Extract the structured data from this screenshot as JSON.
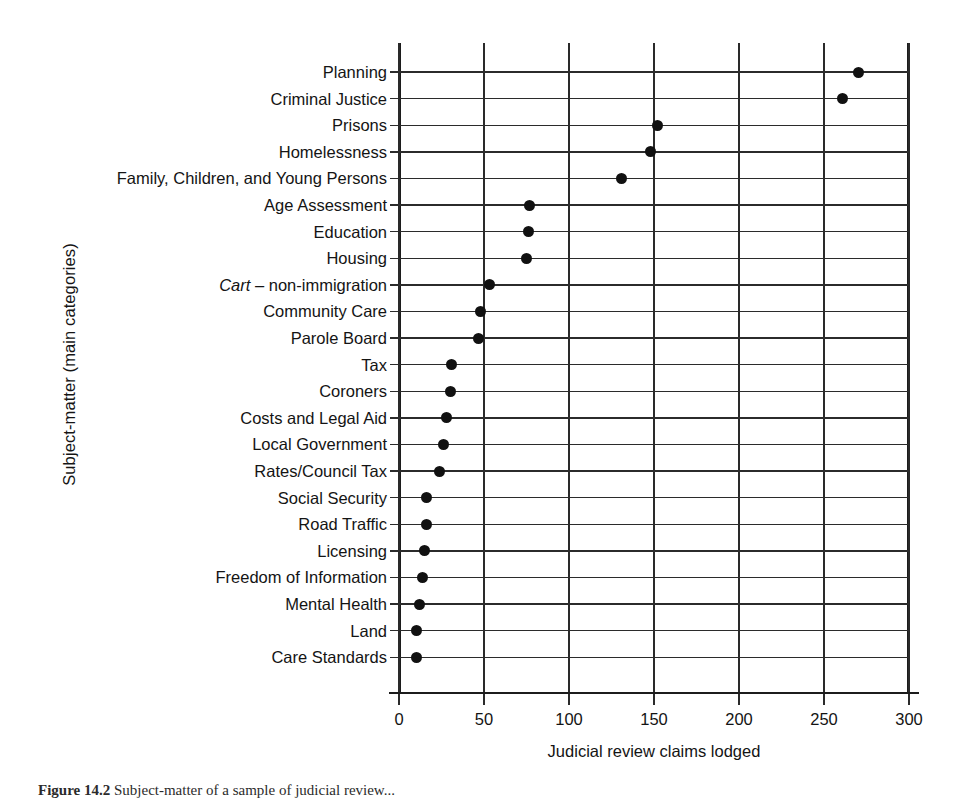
{
  "chart_data": {
    "type": "scatter",
    "title": "",
    "xlabel": "Judicial review claims lodged",
    "ylabel": "Subject-matter (main categories)",
    "xlim": [
      0,
      300
    ],
    "xticks": [
      0,
      50,
      100,
      150,
      200,
      250,
      300
    ],
    "xticklabels": [
      "0",
      "50",
      "100",
      "150",
      "200",
      "250",
      "300"
    ],
    "grid": true,
    "legend": "none",
    "orientation": "horizontal",
    "categories": [
      "Planning",
      "Criminal Justice",
      "Prisons",
      "Homelessness",
      "Family, Children, and Young Persons",
      "Age Assessment",
      "Education",
      "Housing",
      "Cart – non-immigration",
      "Community Care",
      "Parole Board",
      "Tax",
      "Coroners",
      "Costs and Legal Aid",
      "Local Government",
      "Rates/Council Tax",
      "Social Security",
      "Road Traffic",
      "Licensing",
      "Freedom of Information",
      "Mental Health",
      "Land",
      "Care Standards"
    ],
    "values": [
      270,
      261,
      152,
      148,
      131,
      77,
      76,
      75,
      53,
      48,
      47,
      31,
      30,
      28,
      26,
      24,
      16,
      16,
      15,
      14,
      12,
      10,
      10
    ],
    "points": [
      {
        "label": "Planning",
        "value": 270,
        "italic_prefix": ""
      },
      {
        "label": "Criminal Justice",
        "value": 261,
        "italic_prefix": ""
      },
      {
        "label": "Prisons",
        "value": 152,
        "italic_prefix": ""
      },
      {
        "label": "Homelessness",
        "value": 148,
        "italic_prefix": ""
      },
      {
        "label": "Family, Children, and Young Persons",
        "value": 131,
        "italic_prefix": ""
      },
      {
        "label": "Age Assessment",
        "value": 77,
        "italic_prefix": ""
      },
      {
        "label": "Education",
        "value": 76,
        "italic_prefix": ""
      },
      {
        "label": "Housing",
        "value": 75,
        "italic_prefix": ""
      },
      {
        "label": "– non-immigration",
        "value": 53,
        "italic_prefix": "Cart"
      },
      {
        "label": "Community Care",
        "value": 48,
        "italic_prefix": ""
      },
      {
        "label": "Parole Board",
        "value": 47,
        "italic_prefix": ""
      },
      {
        "label": "Tax",
        "value": 31,
        "italic_prefix": ""
      },
      {
        "label": "Coroners",
        "value": 30,
        "italic_prefix": ""
      },
      {
        "label": "Costs and Legal Aid",
        "value": 28,
        "italic_prefix": ""
      },
      {
        "label": "Local Government",
        "value": 26,
        "italic_prefix": ""
      },
      {
        "label": "Rates/Council Tax",
        "value": 24,
        "italic_prefix": ""
      },
      {
        "label": "Social Security",
        "value": 16,
        "italic_prefix": ""
      },
      {
        "label": "Road Traffic",
        "value": 16,
        "italic_prefix": ""
      },
      {
        "label": "Licensing",
        "value": 15,
        "italic_prefix": ""
      },
      {
        "label": "Freedom of Information",
        "value": 14,
        "italic_prefix": ""
      },
      {
        "label": "Mental Health",
        "value": 12,
        "italic_prefix": ""
      },
      {
        "label": "Land",
        "value": 10,
        "italic_prefix": ""
      },
      {
        "label": "Care Standards",
        "value": 10,
        "italic_prefix": ""
      }
    ],
    "marker_color": "#111111",
    "grid_color": "#2b2b2b",
    "axis_color": "#1c1c1c"
  },
  "caption": {
    "number": "Figure 14.2",
    "text": "Subject-matter of a sample of judicial review..."
  }
}
